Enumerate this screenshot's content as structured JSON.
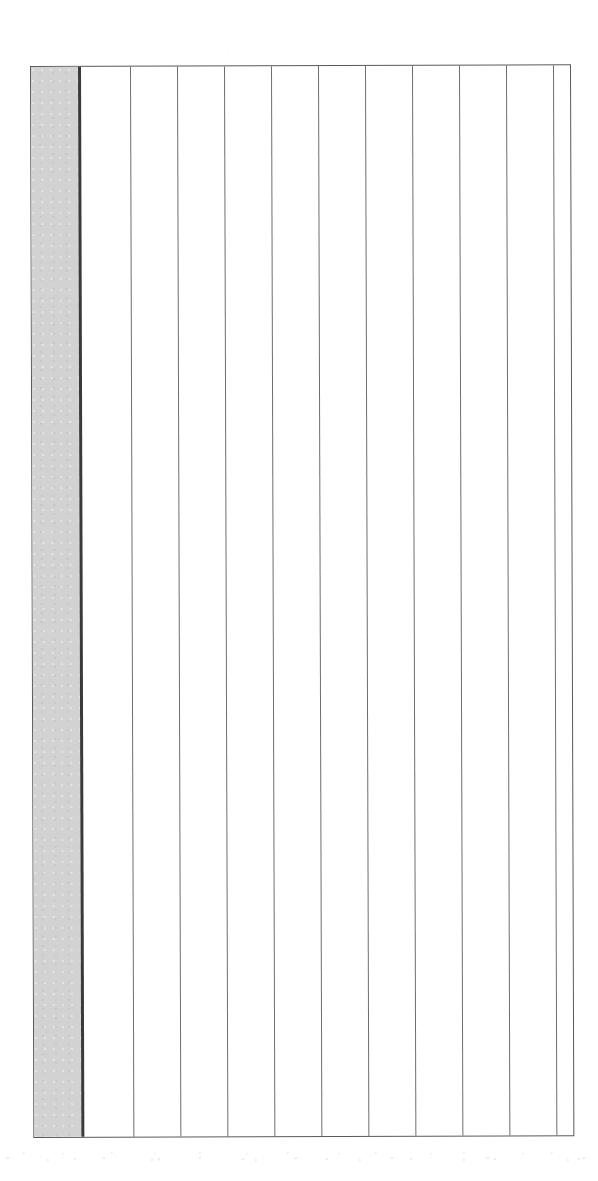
{
  "document": {
    "kind": "blank-ruled-ledger-grid",
    "title": "Blank Ruled Table",
    "orientation": "portrait",
    "background_color": "#ffffff",
    "has_text": false,
    "has_horizontal_rules": false,
    "skew_degrees": -0.18
  },
  "frame": {
    "x": 30,
    "y": 66,
    "width": 541,
    "height": 1072,
    "border_color": "#5a5a5a",
    "border_width": 1.4,
    "fill_color": "#ffffff"
  },
  "shaded_column": {
    "label": "shaded-left-column",
    "x": 31,
    "y": 67,
    "width": 47,
    "height": 1070,
    "fill_color": "#d2d2d2"
  },
  "heavy_rule": {
    "label": "heavy-divider-rule",
    "x": 78,
    "y": 67,
    "width": 3.4,
    "height": 1070,
    "color": "#3a3a3a"
  },
  "column_rules": {
    "color": "#6e6e6e",
    "width": 1.4,
    "positions": [
      130,
      177,
      224,
      271,
      318,
      365,
      412,
      459,
      506,
      553
    ]
  },
  "columns": {
    "shaded_count": 1,
    "blank_count": 11,
    "total_count": 12,
    "cells": [
      {
        "index": 0,
        "name": "shaded-column-cell",
        "shaded": true,
        "content": ""
      },
      {
        "index": 1,
        "name": "blank-column-cell",
        "shaded": false,
        "content": ""
      },
      {
        "index": 2,
        "name": "blank-column-cell",
        "shaded": false,
        "content": ""
      },
      {
        "index": 3,
        "name": "blank-column-cell",
        "shaded": false,
        "content": ""
      },
      {
        "index": 4,
        "name": "blank-column-cell",
        "shaded": false,
        "content": ""
      },
      {
        "index": 5,
        "name": "blank-column-cell",
        "shaded": false,
        "content": ""
      },
      {
        "index": 6,
        "name": "blank-column-cell",
        "shaded": false,
        "content": ""
      },
      {
        "index": 7,
        "name": "blank-column-cell",
        "shaded": false,
        "content": ""
      },
      {
        "index": 8,
        "name": "blank-column-cell",
        "shaded": false,
        "content": ""
      },
      {
        "index": 9,
        "name": "blank-column-cell",
        "shaded": false,
        "content": ""
      },
      {
        "index": 10,
        "name": "blank-column-cell",
        "shaded": false,
        "content": ""
      },
      {
        "index": 11,
        "name": "blank-column-cell",
        "shaded": false,
        "content": ""
      }
    ]
  }
}
